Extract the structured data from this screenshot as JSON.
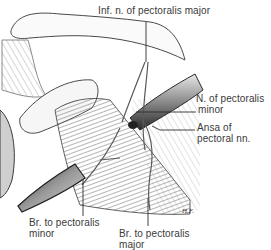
{
  "figure": {
    "artist_signature": "H.F."
  },
  "labels": [
    {
      "id": "inf-n-pectoralis-major",
      "text": "Inf. n. of pectoralis major"
    },
    {
      "id": "n-pectoralis-minor",
      "line1": "N. of pectoralis",
      "line2": "minor"
    },
    {
      "id": "ansa-pectoral",
      "line1": "Ansa of",
      "line2": "pectoral nn."
    },
    {
      "id": "br-pectoralis-minor",
      "line1": "Br. to pectoralis",
      "line2": "minor"
    },
    {
      "id": "br-pectoralis-major",
      "line1": "Br. to pectoralis",
      "line2": "major"
    }
  ],
  "colors": {
    "background": "#ffffff",
    "ink": "#2e2e2e",
    "shade": "#9a9a9a",
    "label_text": "#3a3a3a"
  }
}
